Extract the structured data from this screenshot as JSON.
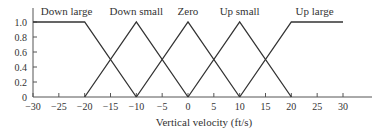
{
  "chart_data": {
    "type": "line",
    "title": "",
    "xlabel": "Vertical velocity (ft/s)",
    "ylabel": "",
    "xlim": [
      -30,
      30
    ],
    "ylim": [
      0,
      1.0
    ],
    "x_ticks": [
      -30,
      -25,
      -20,
      -15,
      -10,
      -5,
      0,
      5,
      10,
      15,
      20,
      25,
      30
    ],
    "y_ticks": [
      0,
      0.2,
      0.4,
      0.6,
      0.8,
      1.0
    ],
    "x_tick_labels": [
      "-30",
      "-25",
      "-20",
      "-15",
      "-10",
      "-5",
      "0",
      "5",
      "10",
      "15",
      "20",
      "25",
      "30"
    ],
    "y_tick_labels": [
      "0",
      "0.2",
      "0.4",
      "0.6",
      "0.8",
      "1.0"
    ],
    "grid": false,
    "legend": "inline labels above each curve",
    "series": [
      {
        "name": "Down large",
        "x": [
          -30,
          -20,
          -10
        ],
        "y": [
          1.0,
          1.0,
          0
        ]
      },
      {
        "name": "Down small",
        "x": [
          -20,
          -10,
          0
        ],
        "y": [
          0,
          1.0,
          0
        ]
      },
      {
        "name": "Zero",
        "x": [
          -10,
          0,
          10
        ],
        "y": [
          0,
          1.0,
          0
        ]
      },
      {
        "name": "Up small",
        "x": [
          0,
          10,
          20
        ],
        "y": [
          0,
          1.0,
          0
        ]
      },
      {
        "name": "Up large",
        "x": [
          10,
          20,
          30
        ],
        "y": [
          0,
          1.0,
          1.0
        ]
      }
    ]
  }
}
